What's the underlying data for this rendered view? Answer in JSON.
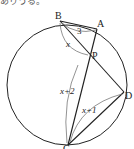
{
  "header_fragment": "ありうる。",
  "diagram": {
    "points": {
      "A": "A",
      "B": "B",
      "C": "C",
      "D": "D",
      "P": "P"
    },
    "segment_labels": {
      "AB": "3",
      "BP": "x",
      "PC": "x+2",
      "PD": "x+1"
    }
  }
}
